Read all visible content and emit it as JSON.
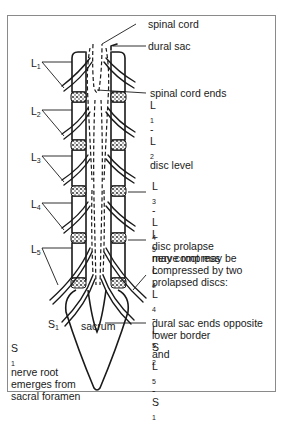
{
  "figure": {
    "type": "anatomical-diagram"
  },
  "vertebral_labels": [
    {
      "id": "L1",
      "base": "L",
      "sub": "1"
    },
    {
      "id": "L2",
      "base": "L",
      "sub": "2"
    },
    {
      "id": "L3",
      "base": "L",
      "sub": "3"
    },
    {
      "id": "L4",
      "base": "L",
      "sub": "4"
    },
    {
      "id": "L5",
      "base": "L",
      "sub": "5"
    },
    {
      "id": "S1",
      "base": "S",
      "sub": "1"
    }
  ],
  "structure_labels": {
    "spinal_cord": "spinal cord",
    "dural_sac": "dural sac",
    "sacrum": "sacrum"
  },
  "annotations": {
    "cord_ends": {
      "line1": "spinal cord ends",
      "line2": {
        "a_base": "L",
        "a_sub": "1",
        "sep": "-",
        "b_base": "L",
        "b_sub": "2",
        "rest": " disc level"
      }
    },
    "l3_l4": {
      "line1": {
        "a_base": "L",
        "a_sub": "3",
        "sep": "-",
        "b_base": "L",
        "b_sub": "4",
        "rest": " disc prolapse"
      },
      "line2": {
        "text": "may compress ",
        "base": "L",
        "sub": "4"
      }
    },
    "l5_root": {
      "line1": {
        "base": "L",
        "sub": "5",
        "rest": " nerve root may be"
      },
      "line2": "compressed by two",
      "line3": "prolapsed discs:",
      "line4": {
        "a_base": "L",
        "a_sub": "4",
        "sep": "-",
        "b_base": "L",
        "b_sub": "5",
        "mid": " and ",
        "c_base": "L",
        "c_sub": "5",
        "sep2": "-",
        "d_base": "S",
        "d_sub": "1"
      }
    },
    "dural_ends": {
      "line1": "dural sac ends opposite",
      "line2": {
        "text": "lower border ",
        "base": "S",
        "sub": "2"
      }
    },
    "s1_root": {
      "line1": {
        "base": "S",
        "sub": "1",
        "rest": " nerve root"
      },
      "line2": "emerges from",
      "line3": "sacral foramen"
    }
  },
  "colors": {
    "ink": "#1a1a1a",
    "frame": "#8a8a8a",
    "background": "#ffffff",
    "disc_fill": "#9a9a9a"
  }
}
